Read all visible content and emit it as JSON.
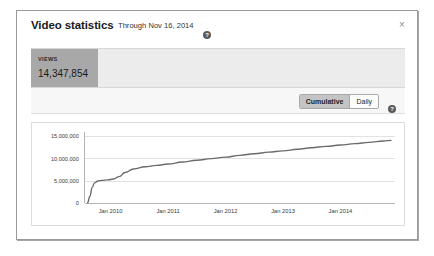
{
  "dialog": {
    "title": "Video statistics",
    "subtitle": "Through Nov 16, 2014",
    "help_icon": "help-icon",
    "help_glyph": "?",
    "close_label": "×"
  },
  "metric": {
    "label": "VIEWS",
    "value": "14,347,854"
  },
  "toolbar": {
    "cumulative_label": "Cumulative",
    "daily_label": "Daily",
    "selected": "Cumulative",
    "help_glyph": "?"
  },
  "colors": {
    "panel_border": "#9a9a9a",
    "metric_bar": "#ececec",
    "metric_tile": "#a8a8a8",
    "toolbar_bg": "#f7f7f7",
    "segment_active": "#c4c4c4",
    "line": "#6b6b6b",
    "grid": "#e2e2e2"
  },
  "chart_data": {
    "type": "line",
    "title": "",
    "xlabel": "",
    "ylabel": "",
    "grid": true,
    "legend": "none",
    "ylim": [
      0,
      16000000
    ],
    "ytick_labels": [
      "0",
      "5,000,000",
      "10,000,000",
      "15,000,000"
    ],
    "ytick_values": [
      0,
      5000000,
      10000000,
      15000000
    ],
    "xtick_labels": [
      "Jan 2010",
      "Jan 2011",
      "Jan 2012",
      "Jan 2013",
      "Jan 2014"
    ],
    "xtick_values": [
      2010.0,
      2011.0,
      2012.0,
      2013.0,
      2014.0
    ],
    "xlim": [
      2009.55,
      2014.95
    ],
    "series": [
      {
        "name": "Views (cumulative)",
        "x": [
          2009.6,
          2009.64,
          2009.68,
          2009.72,
          2009.78,
          2009.85,
          2009.95,
          2010.05,
          2010.15,
          2010.25,
          2010.4,
          2010.6,
          2010.8,
          2011.0,
          2011.25,
          2011.5,
          2011.75,
          2012.0,
          2012.25,
          2012.5,
          2012.75,
          2013.0,
          2013.25,
          2013.5,
          2013.75,
          2014.0,
          2014.25,
          2014.5,
          2014.75,
          2014.88
        ],
        "values": [
          150000,
          1600000,
          3600000,
          4600000,
          5000000,
          5150000,
          5250000,
          5450000,
          6000000,
          6900000,
          7700000,
          8200000,
          8500000,
          8800000,
          9250000,
          9650000,
          10000000,
          10350000,
          10750000,
          11100000,
          11450000,
          11750000,
          12100000,
          12450000,
          12750000,
          13050000,
          13350000,
          13650000,
          13950000,
          14100000
        ]
      }
    ]
  }
}
